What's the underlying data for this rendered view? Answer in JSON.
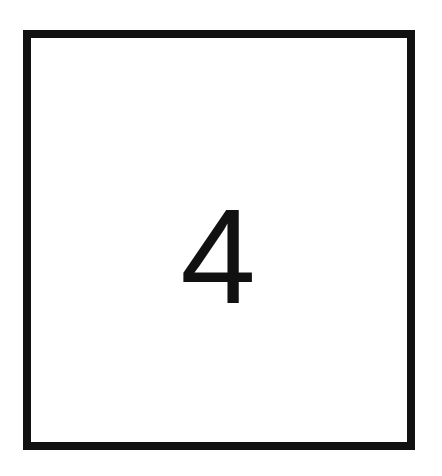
{
  "card": {
    "value": "4",
    "border_color": "#111111",
    "background_color": "#ffffff"
  }
}
